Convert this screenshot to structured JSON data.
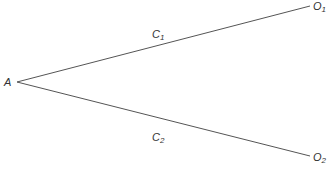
{
  "diagram": {
    "nodes": [
      {
        "id": "A",
        "label": "A",
        "sub": ""
      },
      {
        "id": "O1",
        "label": "O",
        "sub": "1"
      },
      {
        "id": "O2",
        "label": "O",
        "sub": "2"
      }
    ],
    "edges": [
      {
        "from": "A",
        "to": "O1",
        "label": "C",
        "sub": "1"
      },
      {
        "from": "A",
        "to": "O2",
        "label": "C",
        "sub": "2"
      }
    ],
    "line_color": "#555555"
  }
}
